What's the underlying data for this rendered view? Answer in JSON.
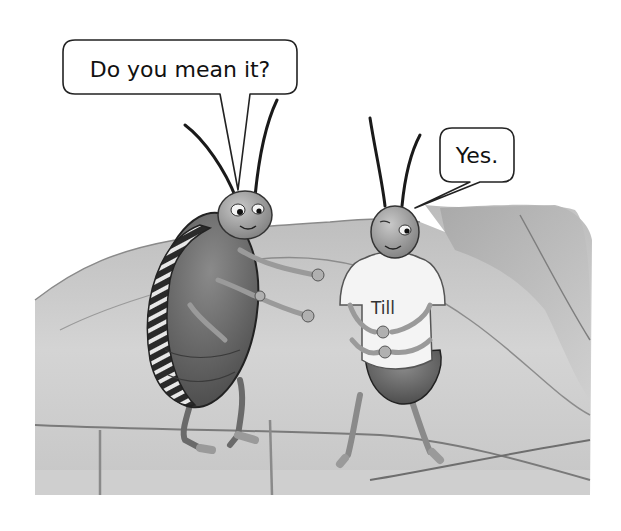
{
  "illustration": {
    "style": "grayscale pencil storybook illustration",
    "scene": "two beetles talking on a large leaf",
    "colors": {
      "background": "#ffffff",
      "leaf_light": "#d6d6d6",
      "leaf_dark": "#9a9a9a",
      "beetle_shell": "#6e6e6e",
      "beetle_head": "#a8a8a8",
      "shirt": "#f4f4f4",
      "outline": "#1a1a1a"
    }
  },
  "bubbles": [
    {
      "speaker": "left-beetle",
      "text": "Do you mean it?"
    },
    {
      "speaker": "right-beetle",
      "text": "Yes."
    }
  ],
  "characters": {
    "left_beetle": {
      "description": "striped-shell beetle gesturing with open hands"
    },
    "right_beetle": {
      "description": "small beetle wearing a white t-shirt",
      "shirt_text": "Till"
    }
  }
}
